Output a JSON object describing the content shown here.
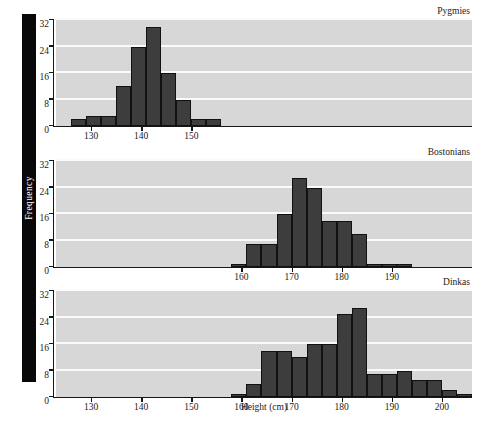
{
  "axis": {
    "ylabel": "Frequency",
    "xlabel": "Height (cm)",
    "yticks": [
      0,
      8,
      16,
      24,
      32
    ],
    "ylim": [
      0,
      32
    ],
    "xlim": [
      123,
      206
    ],
    "panel_bg": "#d7d7d7",
    "bar_color": "#3d3d3d",
    "bar_edge": "#111111",
    "grid_color": "#fbfbfb",
    "spine_color": "#08080a"
  },
  "chart_data": {
    "type": "bar",
    "title": "",
    "xlabel": "Height (cm)",
    "ylabel": "Frequency",
    "ylim": [
      0,
      32
    ],
    "xlim": [
      123,
      206
    ],
    "grid": true,
    "legend": "none",
    "bin_width": 3,
    "panels": [
      {
        "label": "Pygmies",
        "xticks": [
          130,
          140,
          150
        ],
        "bins": [
          {
            "start": 126,
            "end": 129,
            "value": 2
          },
          {
            "start": 129,
            "end": 132,
            "value": 3
          },
          {
            "start": 132,
            "end": 135,
            "value": 3
          },
          {
            "start": 135,
            "end": 138,
            "value": 12
          },
          {
            "start": 138,
            "end": 141,
            "value": 24
          },
          {
            "start": 141,
            "end": 144,
            "value": 30
          },
          {
            "start": 144,
            "end": 147,
            "value": 16
          },
          {
            "start": 147,
            "end": 150,
            "value": 8
          },
          {
            "start": 150,
            "end": 153,
            "value": 2
          },
          {
            "start": 153,
            "end": 156,
            "value": 2
          }
        ]
      },
      {
        "label": "Bostonians",
        "xticks": [
          160,
          170,
          180,
          190
        ],
        "bins": [
          {
            "start": 158,
            "end": 161,
            "value": 1
          },
          {
            "start": 161,
            "end": 164,
            "value": 7
          },
          {
            "start": 164,
            "end": 167,
            "value": 7
          },
          {
            "start": 167,
            "end": 170,
            "value": 16
          },
          {
            "start": 170,
            "end": 173,
            "value": 27
          },
          {
            "start": 173,
            "end": 176,
            "value": 24
          },
          {
            "start": 176,
            "end": 179,
            "value": 14
          },
          {
            "start": 179,
            "end": 182,
            "value": 14
          },
          {
            "start": 182,
            "end": 185,
            "value": 10
          },
          {
            "start": 185,
            "end": 188,
            "value": 1
          },
          {
            "start": 188,
            "end": 191,
            "value": 1
          },
          {
            "start": 191,
            "end": 194,
            "value": 1
          }
        ]
      },
      {
        "label": "Dinkas",
        "xticks": [
          130,
          140,
          150,
          160,
          170,
          180,
          190,
          200
        ],
        "bins": [
          {
            "start": 158,
            "end": 161,
            "value": 1
          },
          {
            "start": 161,
            "end": 164,
            "value": 4
          },
          {
            "start": 164,
            "end": 167,
            "value": 14
          },
          {
            "start": 167,
            "end": 170,
            "value": 14
          },
          {
            "start": 170,
            "end": 173,
            "value": 12
          },
          {
            "start": 173,
            "end": 176,
            "value": 16
          },
          {
            "start": 176,
            "end": 179,
            "value": 16
          },
          {
            "start": 179,
            "end": 182,
            "value": 25
          },
          {
            "start": 182,
            "end": 185,
            "value": 27
          },
          {
            "start": 185,
            "end": 188,
            "value": 7
          },
          {
            "start": 188,
            "end": 191,
            "value": 7
          },
          {
            "start": 191,
            "end": 194,
            "value": 8
          },
          {
            "start": 194,
            "end": 197,
            "value": 5
          },
          {
            "start": 197,
            "end": 200,
            "value": 5
          },
          {
            "start": 200,
            "end": 203,
            "value": 2
          },
          {
            "start": 203,
            "end": 206,
            "value": 1
          }
        ]
      }
    ]
  }
}
